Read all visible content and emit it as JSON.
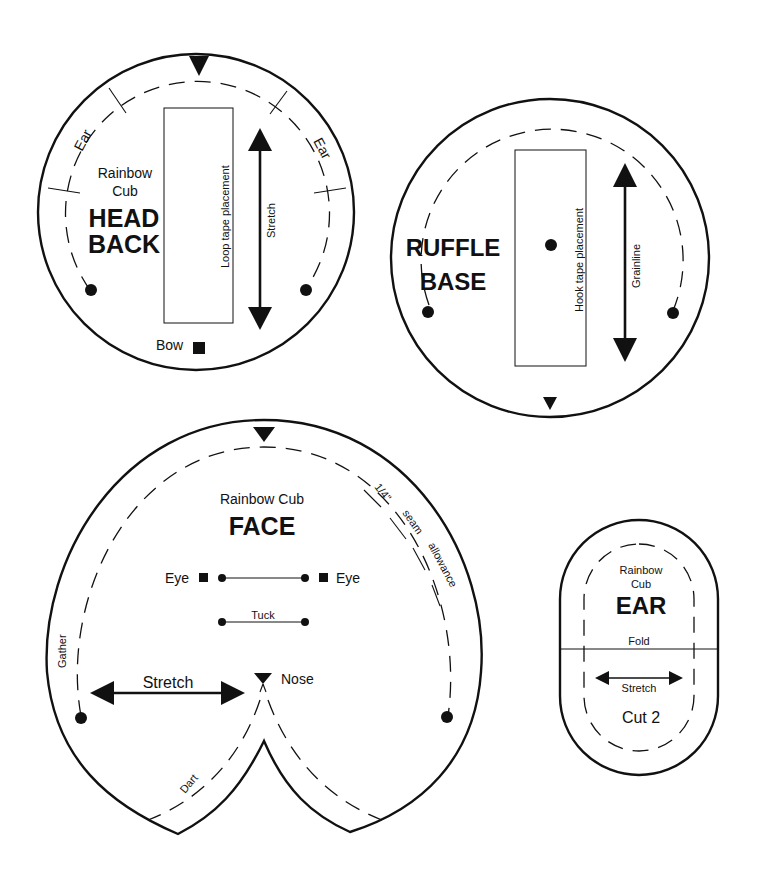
{
  "colors": {
    "ink": "#111111",
    "paper": "#ffffff"
  },
  "pieces": {
    "head_back": {
      "brand_line1": "Rainbow",
      "brand_line2": "Cub",
      "title_line1": "HEAD",
      "title_line2": "BACK",
      "ear_left": "Ear",
      "ear_right": "Ear",
      "tape_label": "Loop tape placement",
      "arrow_label": "Stretch",
      "bow_label": "Bow"
    },
    "ruffle_base": {
      "title_line1": "RUFFLE",
      "title_line2": "BASE",
      "tape_label": "Hook tape placement",
      "arrow_label": "Grainline"
    },
    "face": {
      "brand": "Rainbow Cub",
      "title": "FACE",
      "eye_left": "Eye",
      "eye_right": "Eye",
      "tuck_label": "Tuck",
      "stretch_label": "Stretch",
      "nose_label": "Nose",
      "gather_label": "Gather",
      "dart_label": "Dart",
      "seam_note": [
        "1/4\"",
        "seam",
        "allowance"
      ]
    },
    "ear": {
      "brand_line1": "Rainbow",
      "brand_line2": "Cub",
      "title": "EAR",
      "fold_label": "Fold",
      "stretch_label": "Stretch",
      "cut_label": "Cut 2"
    }
  }
}
